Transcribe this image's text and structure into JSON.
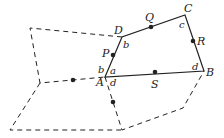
{
  "diagram": {
    "vertices": {
      "A": "A",
      "B": "B",
      "C": "C",
      "D": "D"
    },
    "midpoints": {
      "P": "P",
      "Q": "Q",
      "R": "R",
      "S": "S"
    },
    "angles": {
      "A_inner": "a",
      "A_left": "b",
      "A_lower": "d",
      "D": "b",
      "C": "c",
      "B": "d"
    }
  }
}
